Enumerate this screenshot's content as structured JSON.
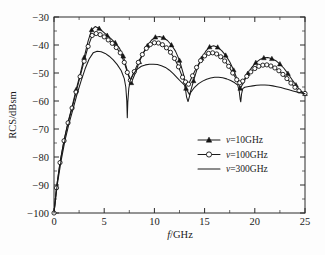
{
  "chart_data": {
    "type": "line",
    "title": "",
    "xlabel": "f/GHz",
    "ylabel": "RCS/dBsm",
    "xlim": [
      0,
      25
    ],
    "ylim": [
      -100,
      -30
    ],
    "xticks": [
      0,
      5,
      10,
      15,
      20,
      25
    ],
    "yticks": [
      -100,
      -90,
      -80,
      -70,
      -60,
      -50,
      -40,
      -30
    ],
    "xtick_labels": [
      "0",
      "5",
      "10",
      "15",
      "20",
      "25"
    ],
    "ytick_labels": [
      "-100",
      "-90",
      "-80",
      "-70",
      "-60",
      "-50",
      "-40",
      "-30"
    ],
    "grid": false,
    "minor_ticks": true,
    "legend_position": "center-right",
    "legend": [
      {
        "label": "ν=10GHz",
        "marker": "filled-triangle",
        "line": "solid"
      },
      {
        "label": "ν=100GHz",
        "marker": "open-circle",
        "line": "solid"
      },
      {
        "label": "ν=300GHz",
        "marker": "none",
        "line": "solid"
      }
    ],
    "series": [
      {
        "name": "ν=10GHz",
        "marker": "filled-triangle",
        "x": [
          0.0,
          0.25,
          0.6,
          1.0,
          1.4,
          1.8,
          2.2,
          2.6,
          3.0,
          3.4,
          3.75,
          4.1,
          4.5,
          4.9,
          5.3,
          5.7,
          6.1,
          6.5,
          6.9,
          7.3,
          7.7,
          8.1,
          8.5,
          8.9,
          9.3,
          9.7,
          10.1,
          10.5,
          10.9,
          11.3,
          11.7,
          12.1,
          12.5,
          12.9,
          13.15,
          13.5,
          13.9,
          14.3,
          14.7,
          15.1,
          15.5,
          15.9,
          16.3,
          16.7,
          17.1,
          17.5,
          17.9,
          18.3,
          18.55,
          18.9,
          19.3,
          19.7,
          20.1,
          20.5,
          20.9,
          21.3,
          21.7,
          22.1,
          22.5,
          22.9,
          23.3,
          23.7,
          24.1,
          24.5,
          25.0
        ],
        "y": [
          -100.0,
          -91.0,
          -82.0,
          -74.0,
          -67.5,
          -62.0,
          -56.0,
          -50.5,
          -44.5,
          -38.5,
          -34.6,
          -33.4,
          -34.1,
          -35.3,
          -36.6,
          -37.8,
          -39.2,
          -41.0,
          -44.0,
          -49.2,
          -53.5,
          -50.0,
          -46.0,
          -42.8,
          -40.3,
          -38.3,
          -37.2,
          -37.0,
          -37.4,
          -38.4,
          -40.0,
          -42.2,
          -45.5,
          -50.5,
          -55.5,
          -57.8,
          -52.8,
          -48.0,
          -44.8,
          -42.3,
          -40.7,
          -40.3,
          -40.8,
          -42.0,
          -43.7,
          -46.0,
          -49.0,
          -52.8,
          -55.5,
          -53.3,
          -50.2,
          -48.0,
          -46.3,
          -45.2,
          -44.6,
          -44.5,
          -44.9,
          -45.6,
          -46.8,
          -48.3,
          -50.2,
          -52.3,
          -54.3,
          -56.2,
          -57.4
        ]
      },
      {
        "name": "ν=100GHz",
        "marker": "open-circle",
        "x": [
          0.0,
          0.25,
          0.6,
          1.0,
          1.4,
          1.8,
          2.2,
          2.6,
          3.0,
          3.4,
          3.8,
          4.2,
          4.6,
          5.0,
          5.4,
          5.8,
          6.2,
          6.6,
          7.0,
          7.3,
          7.6,
          8.0,
          8.4,
          8.8,
          9.2,
          9.6,
          10.0,
          10.4,
          10.8,
          11.2,
          11.6,
          12.0,
          12.4,
          12.8,
          13.1,
          13.4,
          13.8,
          14.2,
          14.6,
          15.0,
          15.4,
          15.8,
          16.2,
          16.6,
          17.0,
          17.4,
          17.8,
          18.2,
          18.5,
          18.8,
          19.2,
          19.6,
          20.0,
          20.4,
          20.8,
          21.2,
          21.6,
          22.0,
          22.4,
          22.8,
          23.2,
          23.6,
          24.0,
          24.4,
          25.0
        ],
        "y": [
          -100.0,
          -91.0,
          -82.0,
          -74.2,
          -67.8,
          -62.5,
          -56.8,
          -51.3,
          -45.8,
          -40.5,
          -36.6,
          -35.9,
          -36.3,
          -37.1,
          -38.2,
          -39.4,
          -40.9,
          -42.8,
          -46.2,
          -49.8,
          -52.6,
          -49.5,
          -46.2,
          -43.4,
          -41.2,
          -39.8,
          -39.2,
          -39.3,
          -39.9,
          -41.0,
          -42.6,
          -44.8,
          -47.8,
          -51.5,
          -53.2,
          -54.0,
          -51.0,
          -48.0,
          -45.6,
          -43.9,
          -43.0,
          -42.8,
          -43.2,
          -44.2,
          -45.7,
          -47.6,
          -50.0,
          -52.4,
          -53.5,
          -52.9,
          -51.2,
          -49.6,
          -48.4,
          -47.6,
          -47.2,
          -47.1,
          -47.5,
          -48.2,
          -49.2,
          -50.5,
          -52.0,
          -53.6,
          -55.1,
          -56.4,
          -57.3
        ]
      },
      {
        "name": "ν=300GHz",
        "marker": "none",
        "x": [
          0.0,
          0.3,
          0.7,
          1.1,
          1.5,
          1.9,
          2.3,
          2.7,
          3.1,
          3.5,
          3.9,
          4.3,
          4.7,
          5.1,
          5.5,
          5.9,
          6.3,
          6.7,
          7.0,
          7.15,
          7.25,
          7.3,
          7.35,
          7.45,
          7.6,
          7.9,
          8.3,
          8.7,
          9.1,
          9.5,
          9.9,
          10.3,
          10.7,
          11.1,
          11.5,
          11.9,
          12.3,
          12.7,
          13.0,
          13.1,
          13.2,
          13.35,
          13.6,
          14.0,
          14.4,
          14.8,
          15.2,
          15.6,
          16.0,
          16.4,
          16.8,
          17.2,
          17.6,
          18.0,
          18.3,
          18.45,
          18.55,
          18.6,
          18.68,
          18.8,
          19.0,
          19.4,
          19.8,
          20.2,
          20.6,
          21.0,
          21.4,
          21.8,
          22.2,
          22.6,
          23.0,
          23.4,
          23.8,
          24.2,
          24.6,
          25.0
        ],
        "y": [
          -100.0,
          -90.5,
          -81.5,
          -74.0,
          -68.0,
          -62.8,
          -57.5,
          -52.8,
          -48.5,
          -45.0,
          -42.8,
          -42.2,
          -42.4,
          -43.0,
          -44.0,
          -45.3,
          -47.0,
          -49.2,
          -52.0,
          -55.0,
          -60.0,
          -66.0,
          -60.5,
          -55.5,
          -52.6,
          -50.3,
          -48.6,
          -47.6,
          -47.1,
          -46.9,
          -46.9,
          -47.0,
          -47.4,
          -48.0,
          -49.0,
          -50.3,
          -51.8,
          -53.3,
          -54.3,
          -56.0,
          -58.5,
          -60.2,
          -57.0,
          -55.1,
          -53.8,
          -52.9,
          -52.2,
          -51.8,
          -51.5,
          -51.5,
          -51.7,
          -52.1,
          -52.7,
          -53.5,
          -54.3,
          -56.5,
          -59.5,
          -60.3,
          -57.5,
          -55.6,
          -55.1,
          -54.8,
          -54.6,
          -54.4,
          -54.3,
          -54.3,
          -54.4,
          -54.6,
          -54.9,
          -55.2,
          -55.6,
          -56.0,
          -56.4,
          -56.8,
          -57.1,
          -57.4
        ]
      }
    ]
  }
}
